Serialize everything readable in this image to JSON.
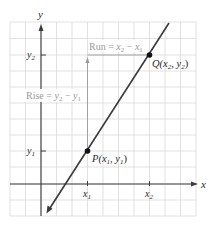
{
  "figure": {
    "type": "slope-diagram",
    "axes": {
      "x_label": "x",
      "y_label": "y"
    },
    "ticks": {
      "x": [
        {
          "label": "x",
          "sub": "1"
        },
        {
          "label": "x",
          "sub": "2"
        }
      ],
      "y": [
        {
          "label": "y",
          "sub": "1"
        },
        {
          "label": "y",
          "sub": "2"
        }
      ]
    },
    "points": [
      {
        "name": "P",
        "label_prefix": "P(",
        "x": "x",
        "x_sub": "1",
        "sep": ", ",
        "y": "y",
        "y_sub": "1",
        "suffix": ")"
      },
      {
        "name": "Q",
        "label_prefix": "Q(",
        "x": "x",
        "x_sub": "2",
        "sep": ", ",
        "y": "y",
        "y_sub": "2",
        "suffix": ")"
      }
    ],
    "annotations": {
      "run": {
        "word": "Run = ",
        "a": "x",
        "a_sub": "2",
        "minus": " − ",
        "b": "x",
        "b_sub": "1"
      },
      "rise": {
        "word": "Rise = ",
        "a": "y",
        "a_sub": "2",
        "minus": " − ",
        "b": "y",
        "b_sub": "1"
      }
    },
    "colors": {
      "grid": "#d9d9d9",
      "axis": "#3a3a3a",
      "line": "#3a3a3a",
      "guide": "#9a9a9a",
      "point": "#111111"
    }
  }
}
